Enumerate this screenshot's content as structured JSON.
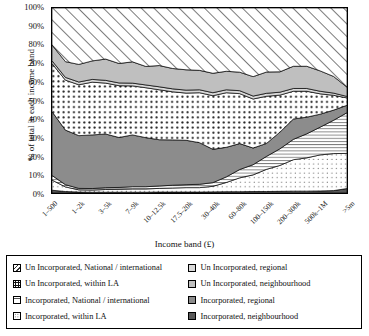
{
  "chart_data": {
    "type": "area",
    "stacked": true,
    "stack_normalized": true,
    "title": "",
    "xlabel": "Income band (£)",
    "ylabel": "% of total in each income band",
    "ylim": [
      0,
      100
    ],
    "yticks": [
      "0%",
      "10%",
      "20%",
      "30%",
      "40%",
      "50%",
      "60%",
      "70%",
      "80%",
      "90%",
      "100%"
    ],
    "grid": false,
    "legend_position": "bottom",
    "x": [
      "1–500",
      "500–1k",
      "1–2k",
      "2–3k",
      "3–5k",
      "5–7k",
      "7–9k",
      "9–10k",
      "10–12.5k",
      "12.5–15k",
      "17.5–20k",
      "20–25k",
      "30–40k",
      "40–50k",
      "60–80k",
      "80–100k",
      "100–150k",
      "150–200k",
      "200–300k",
      "300–500k",
      "500k–1M",
      "1–5m",
      ">5m"
    ],
    "xtick_labels": [
      "1–500",
      "1–2k",
      "3–5k",
      "7–9k",
      "10–12.5k",
      "17.5–20k",
      "30–40k",
      "60–80k",
      "100–150k",
      "200–300k",
      "500k–1M",
      ">5m"
    ],
    "xtick_indices": [
      0,
      2,
      4,
      6,
      8,
      10,
      12,
      14,
      16,
      18,
      20,
      22
    ],
    "series": [
      {
        "name": "Incorporated, neighbourhood",
        "fill": "#595959",
        "pattern": "solid",
        "values": [
          1.5,
          0.8,
          0.5,
          0.4,
          0.4,
          0.4,
          0.4,
          0.4,
          0.5,
          0.5,
          0.5,
          0.5,
          0.6,
          0.7,
          0.7,
          0.8,
          0.8,
          0.9,
          1.0,
          1.0,
          1.1,
          1.3,
          2.4
        ]
      },
      {
        "name": "Incorporated, within LA",
        "fill": "#ffffff",
        "pattern": "dots-sparse",
        "values": [
          5.5,
          2.5,
          1.2,
          1.2,
          1.5,
          1.6,
          1.8,
          1.8,
          2.0,
          2.2,
          2.4,
          2.4,
          3.0,
          5.0,
          7.5,
          9.0,
          12.0,
          14.0,
          17.0,
          18.0,
          19.5,
          20.0,
          19.0
        ]
      },
      {
        "name": "Incorporated, National / international",
        "fill": "#ffffff",
        "pattern": "hlines",
        "values": [
          2.5,
          1.2,
          0.8,
          0.8,
          1.0,
          1.0,
          1.2,
          1.2,
          1.3,
          1.5,
          1.6,
          1.8,
          2.0,
          3.0,
          4.5,
          5.5,
          7.0,
          9.0,
          11.0,
          13.0,
          15.0,
          18.0,
          22.0
        ]
      },
      {
        "name": "Incorporated, regional",
        "fill": "#8c8c8c",
        "pattern": "solid",
        "values": [
          34.5,
          29.5,
          28.5,
          29.0,
          29.0,
          27.0,
          28.0,
          26.5,
          25.0,
          24.5,
          24.0,
          22.5,
          18.0,
          16.0,
          14.0,
          9.0,
          7.0,
          9.0,
          11.0,
          9.0,
          7.0,
          5.5,
          4.0
        ]
      },
      {
        "name": "Un Incorporated, within LA",
        "fill": "#ffffff",
        "pattern": "dots-dense",
        "values": [
          26.0,
          27.0,
          27.5,
          28.5,
          27.5,
          28.0,
          26.5,
          27.0,
          27.0,
          26.0,
          25.5,
          27.0,
          29.0,
          29.5,
          27.0,
          26.5,
          25.5,
          20.0,
          15.0,
          14.0,
          11.0,
          8.0,
          4.0
        ]
      },
      {
        "name": "Un Incorporated, regional",
        "fill": "#d9d9d9",
        "pattern": "solid",
        "values": [
          1.5,
          1.5,
          1.5,
          1.5,
          1.5,
          1.5,
          1.5,
          1.5,
          1.6,
          1.6,
          1.6,
          1.6,
          1.6,
          1.6,
          1.6,
          1.6,
          1.6,
          1.6,
          1.5,
          1.5,
          1.4,
          1.2,
          0.8
        ]
      },
      {
        "name": "Un Incorporated, neighbourhood",
        "fill": "#bfbfbf",
        "pattern": "solid",
        "values": [
          8.5,
          8.5,
          9.5,
          10.0,
          11.5,
          10.5,
          11.5,
          10.0,
          11.5,
          11.0,
          11.0,
          10.5,
          10.5,
          10.0,
          10.0,
          10.5,
          11.5,
          11.0,
          12.0,
          12.0,
          11.0,
          9.0,
          5.0
        ]
      },
      {
        "name": "Un Incorporated, National / international",
        "fill": "#ffffff",
        "pattern": "diagonal",
        "values": [
          20.0,
          29.0,
          30.5,
          28.6,
          27.6,
          30.0,
          29.1,
          31.6,
          31.1,
          32.7,
          33.4,
          33.7,
          35.3,
          34.2,
          34.7,
          37.1,
          34.6,
          34.5,
          31.5,
          31.5,
          34.0,
          37.0,
          42.8
        ]
      }
    ]
  },
  "legend": {
    "left_column": [
      {
        "label": "Un Incorporated, National / international",
        "swatch": "diagonal"
      },
      {
        "label": "Un Incorporated, within LA",
        "swatch": "dots-dense"
      },
      {
        "label": "Incorporated, National / international",
        "swatch": "hlines"
      },
      {
        "label": "Incorporated, within LA",
        "swatch": "dots-sparse"
      }
    ],
    "right_column": [
      {
        "label": "Un Incorporated, regional",
        "swatch": "solid-d9d9d9"
      },
      {
        "label": "Un Incorporated, neighbourhood",
        "swatch": "solid-bfbfbf"
      },
      {
        "label": "Incorporated, regional",
        "swatch": "solid-8c8c8c"
      },
      {
        "label": "Incorporated, neighbourhood",
        "swatch": "solid-595959"
      }
    ]
  }
}
